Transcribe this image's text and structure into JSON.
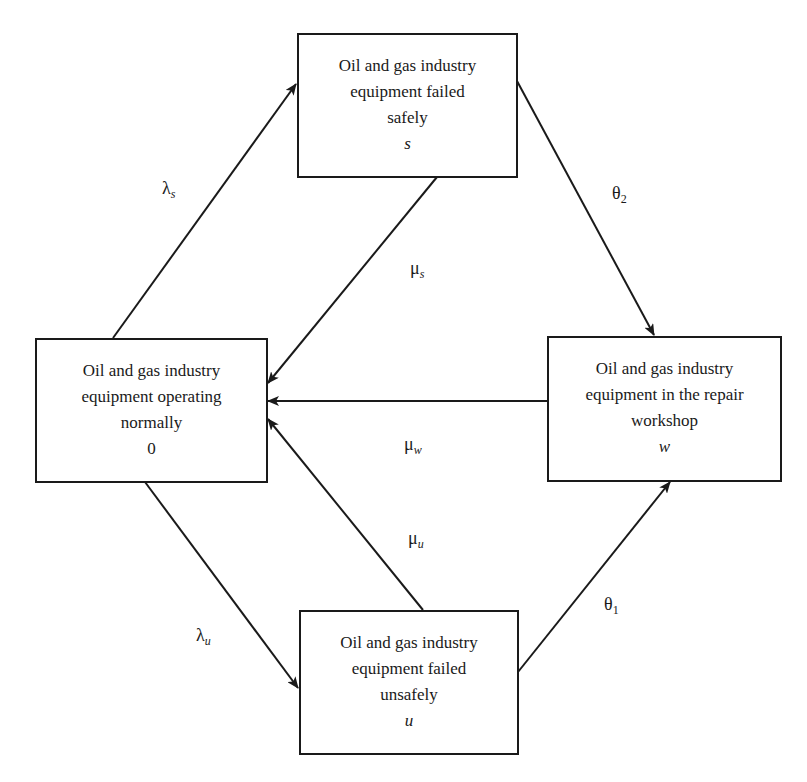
{
  "diagram": {
    "type": "state-transition",
    "line_color": "#1a1a1a",
    "states": [
      {
        "id": "0",
        "lines": [
          "Oil and gas industry",
          "equipment operating",
          "normally"
        ],
        "symbol": "0"
      },
      {
        "id": "s",
        "lines": [
          "Oil and gas industry",
          "equipment failed",
          "safely"
        ],
        "symbol": "s"
      },
      {
        "id": "w",
        "lines": [
          "Oil and gas industry",
          "equipment in the repair",
          "workshop"
        ],
        "symbol": "w"
      },
      {
        "id": "u",
        "lines": [
          "Oil and gas industry",
          "equipment failed",
          "unsafely"
        ],
        "symbol": "u"
      }
    ],
    "transitions": [
      {
        "from": "0",
        "to": "s",
        "base": "λ",
        "sub": "s"
      },
      {
        "from": "s",
        "to": "0",
        "base": "μ",
        "sub": "s"
      },
      {
        "from": "s",
        "to": "w",
        "base": "θ",
        "sub": "2"
      },
      {
        "from": "w",
        "to": "0",
        "base": "μ",
        "sub": "w"
      },
      {
        "from": "u",
        "to": "0",
        "base": "μ",
        "sub": "u"
      },
      {
        "from": "0",
        "to": "u",
        "base": "λ",
        "sub": "u"
      },
      {
        "from": "u",
        "to": "w",
        "base": "θ",
        "sub": "1"
      }
    ]
  }
}
